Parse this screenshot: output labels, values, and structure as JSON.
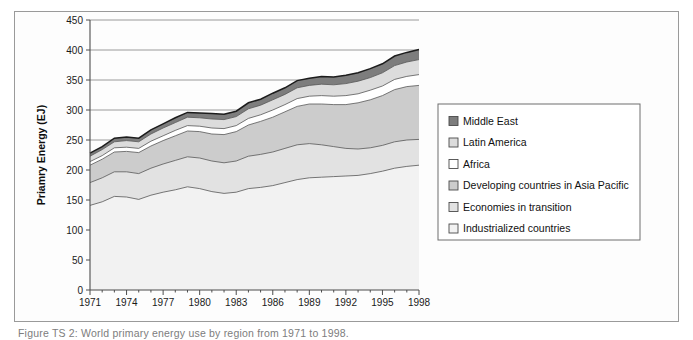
{
  "figure": {
    "caption": "Figure TS 2: World primary energy use by region from 1971 to 1998.",
    "frame_color": "#9a9a9a",
    "background": "#fdfdfd"
  },
  "chart_data": {
    "type": "area",
    "stacked": true,
    "title": "",
    "xlabel": "",
    "ylabel": "Priamry Energy (EJ)",
    "ylim": [
      0,
      450
    ],
    "ytick_step": 50,
    "yticks": [
      0,
      50,
      100,
      150,
      200,
      250,
      300,
      350,
      400,
      450
    ],
    "grid": true,
    "legend_position": "right",
    "x": [
      1971,
      1972,
      1973,
      1974,
      1975,
      1976,
      1977,
      1978,
      1979,
      1980,
      1981,
      1982,
      1983,
      1984,
      1985,
      1986,
      1987,
      1988,
      1989,
      1990,
      1991,
      1992,
      1993,
      1994,
      1995,
      1996,
      1997,
      1998
    ],
    "xticks": [
      1971,
      1974,
      1977,
      1980,
      1983,
      1986,
      1989,
      1992,
      1995,
      1998
    ],
    "xtick_labels": [
      "1971",
      "1974",
      "1977",
      "1980",
      "1983",
      "1986",
      "1989",
      "1992",
      "1995",
      "1998"
    ],
    "series": [
      {
        "name": "Industrialized countries",
        "color": "#f2f2f2",
        "values": [
          141,
          147,
          156,
          155,
          151,
          158,
          163,
          167,
          172,
          169,
          164,
          161,
          163,
          169,
          171,
          174,
          179,
          184,
          187,
          188,
          189,
          190,
          191,
          194,
          198,
          203,
          206,
          208
        ]
      },
      {
        "name": "Economies in transition",
        "color": "#e2e2e2",
        "values": [
          38,
          40,
          41,
          42,
          43,
          45,
          47,
          49,
          50,
          51,
          51,
          51,
          52,
          54,
          55,
          56,
          57,
          58,
          57,
          54,
          50,
          46,
          44,
          43,
          43,
          44,
          44,
          43
        ]
      },
      {
        "name": "Developing countries in Asia Pacific",
        "color": "#cccccc",
        "values": [
          29,
          31,
          33,
          34,
          35,
          37,
          39,
          41,
          43,
          44,
          45,
          47,
          49,
          52,
          55,
          58,
          61,
          64,
          66,
          68,
          70,
          73,
          77,
          80,
          83,
          87,
          89,
          90
        ]
      },
      {
        "name": "Africa",
        "color": "#ffffff",
        "values": [
          6,
          6,
          7,
          7,
          7,
          8,
          8,
          9,
          9,
          9,
          10,
          10,
          10,
          11,
          11,
          12,
          12,
          13,
          13,
          14,
          14,
          15,
          15,
          16,
          16,
          17,
          17,
          18
        ]
      },
      {
        "name": "Latin America",
        "color": "#dcdcdc",
        "values": [
          9,
          10,
          10,
          11,
          11,
          12,
          13,
          13,
          14,
          14,
          15,
          15,
          15,
          16,
          16,
          17,
          17,
          18,
          18,
          19,
          19,
          20,
          21,
          21,
          22,
          23,
          24,
          25
        ]
      },
      {
        "name": "Middle East",
        "color": "#7d7d7d",
        "values": [
          5,
          5,
          6,
          6,
          6,
          7,
          7,
          8,
          8,
          8,
          9,
          9,
          9,
          10,
          10,
          11,
          11,
          12,
          12,
          13,
          13,
          14,
          14,
          15,
          15,
          16,
          16,
          17
        ]
      }
    ],
    "legend_order_top_to_bottom": [
      "Middle East",
      "Latin America",
      "Africa",
      "Developing countries in Asia Pacific",
      "Economies in transition",
      "Industrialized countries"
    ]
  }
}
